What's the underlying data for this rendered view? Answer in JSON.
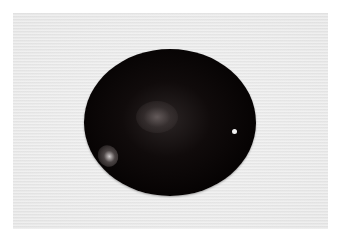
{
  "image": {
    "description": "Photograph of a dark, glossy oval cabochon stone on a light gray textured background with a white border",
    "colors": {
      "border": "#ffffff",
      "background": "#ececec",
      "stone": "#0a0606",
      "highlight": "#f2f2f2"
    }
  }
}
